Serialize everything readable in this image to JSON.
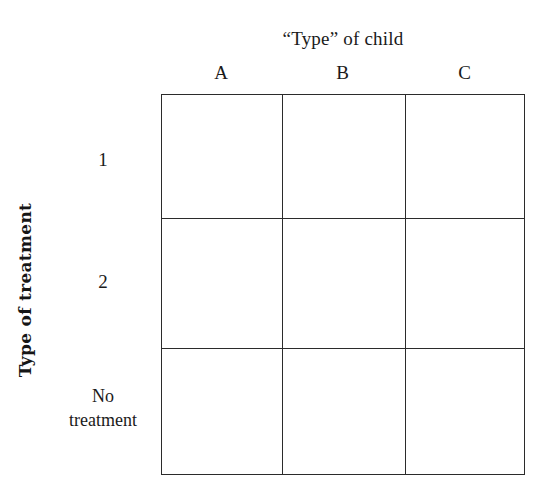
{
  "figure": {
    "column_axis_title": "“Type” of child",
    "row_axis_title": "Type of treatment",
    "column_headers": [
      "A",
      "B",
      "C"
    ],
    "row_labels": [
      {
        "lines": [
          "1"
        ]
      },
      {
        "lines": [
          "2"
        ]
      },
      {
        "lines": [
          "No",
          "treatment"
        ]
      }
    ],
    "cells": [
      [
        "",
        "",
        ""
      ],
      [
        "",
        "",
        ""
      ],
      [
        "",
        "",
        ""
      ]
    ],
    "colors": {
      "background": "#ffffff",
      "line": "#2b2b2b",
      "text": "#1a1a1a"
    }
  }
}
